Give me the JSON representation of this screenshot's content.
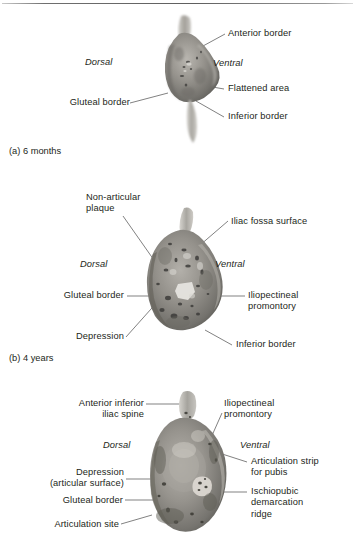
{
  "figure": {
    "title_rule": "horizontal-rule",
    "panels": [
      {
        "id": "a",
        "caption": "(a) 6 months",
        "orientation_left": "Dorsal",
        "orientation_right": "Ventral",
        "labels": [
          {
            "key": "anterior-border",
            "text": "Anterior border"
          },
          {
            "key": "flattened-area",
            "text": "Flattened area"
          },
          {
            "key": "inferior-border",
            "text": "Inferior border"
          },
          {
            "key": "gluteal-border",
            "text": "Gluteal border"
          }
        ]
      },
      {
        "id": "b",
        "caption": "(b) 4 years",
        "orientation_left": "Dorsal",
        "orientation_right": "Ventral",
        "labels": [
          {
            "key": "non-articular-plaque",
            "text": "Non-articular\nplaque"
          },
          {
            "key": "iliac-fossa-surface",
            "text": "Iliac fossa surface"
          },
          {
            "key": "gluteal-border",
            "text": "Gluteal border"
          },
          {
            "key": "iliopectineal-promontory",
            "text": "Iliopectineal\npromontory"
          },
          {
            "key": "depression",
            "text": "Depression"
          },
          {
            "key": "inferior-border",
            "text": "Inferior border"
          }
        ]
      },
      {
        "id": "c",
        "caption": "",
        "orientation_left": "Dorsal",
        "orientation_right": "Ventral",
        "labels": [
          {
            "key": "anterior-inferior-iliac-spine",
            "text": "Anterior inferior\niliac spine"
          },
          {
            "key": "iliopectineal-promontory",
            "text": "Iliopectineal\npromontory"
          },
          {
            "key": "depression-articular-surface",
            "text": "Depression\n(articular surface)"
          },
          {
            "key": "articulation-strip-for-pubis",
            "text": "Articulation strip\nfor pubis"
          },
          {
            "key": "gluteal-border",
            "text": "Gluteal border"
          },
          {
            "key": "ischiopubic-demarcation-ridge",
            "text": "Ischiopubic\ndemarcation\nridge"
          },
          {
            "key": "articulation-site",
            "text": "Articulation site"
          }
        ]
      }
    ]
  },
  "colors": {
    "background": "#ffffff",
    "text": "#231f20",
    "leader_line": "#4a4a4a",
    "bone_mid": "#8a8a86",
    "bone_light": "#c9c7c1",
    "bone_dark": "#4e4d4b",
    "rule": "#5f5f5f"
  }
}
